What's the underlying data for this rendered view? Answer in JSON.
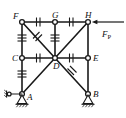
{
  "figure": {
    "type": "structural-truss-diagram",
    "background_color": "#ffffff",
    "line_color": "#1a1a1a"
  },
  "nodes": [
    {
      "id": "F",
      "label": "F",
      "x": 22,
      "y": 22,
      "label_dx": -9,
      "label_dy": -3
    },
    {
      "id": "G",
      "label": "G",
      "x": 55,
      "y": 22,
      "label_dx": -3,
      "label_dy": -4
    },
    {
      "id": "H",
      "label": "H",
      "x": 88,
      "y": 22,
      "label_dx": -3,
      "label_dy": -4
    },
    {
      "id": "C",
      "label": "C",
      "x": 22,
      "y": 58,
      "label_dx": -10,
      "label_dy": 3
    },
    {
      "id": "D",
      "label": "D",
      "x": 55,
      "y": 58,
      "label_dx": -2,
      "label_dy": 11
    },
    {
      "id": "E",
      "label": "E",
      "x": 88,
      "y": 58,
      "label_dx": 5,
      "label_dy": 3
    },
    {
      "id": "A",
      "label": "A",
      "x": 22,
      "y": 94,
      "label_dx": 5,
      "label_dy": 6
    },
    {
      "id": "B",
      "label": "B",
      "x": 88,
      "y": 94,
      "label_dx": 5,
      "label_dy": 3
    }
  ],
  "members": [
    {
      "from": "F",
      "to": "G",
      "ticks": 2,
      "tick_style": "perpendicular"
    },
    {
      "from": "G",
      "to": "H",
      "ticks": 2,
      "tick_style": "perpendicular"
    },
    {
      "from": "C",
      "to": "D",
      "ticks": 2,
      "tick_style": "perpendicular"
    },
    {
      "from": "D",
      "to": "E",
      "ticks": 2,
      "tick_style": "perpendicular"
    },
    {
      "from": "F",
      "to": "C",
      "ticks": 3,
      "tick_style": "perpendicular"
    },
    {
      "from": "C",
      "to": "A",
      "ticks": 3,
      "tick_style": "perpendicular"
    },
    {
      "from": "G",
      "to": "D",
      "ticks": 3,
      "tick_style": "perpendicular"
    },
    {
      "from": "H",
      "to": "E",
      "ticks": 0,
      "tick_style": "none"
    },
    {
      "from": "E",
      "to": "B",
      "ticks": 0,
      "tick_style": "none"
    },
    {
      "from": "F",
      "to": "D",
      "ticks": 2,
      "tick_style": "slash"
    },
    {
      "from": "D",
      "to": "H",
      "ticks": 0,
      "tick_style": "none"
    },
    {
      "from": "D",
      "to": "A",
      "ticks": 0,
      "tick_style": "none"
    },
    {
      "from": "D",
      "to": "B",
      "ticks": 2,
      "tick_style": "slash"
    }
  ],
  "load": {
    "label": "F",
    "subscript": "P",
    "applied_at": "H",
    "direction": "left",
    "arrow_tail_x": 124,
    "arrow_head_x": 92,
    "arrow_y": 22,
    "label_x": 104,
    "label_y": 36
  },
  "supports": [
    {
      "at": "A",
      "kind": "pin-on-ground",
      "x": 22,
      "y": 94,
      "ground_y": 108
    },
    {
      "at": "B",
      "kind": "pin-on-ground",
      "x": 88,
      "y": 94,
      "ground_y": 108
    }
  ],
  "link_support": {
    "at": "A",
    "kind": "horizontal-link-roller",
    "x_start": 8,
    "x_end": 22,
    "y": 94
  }
}
